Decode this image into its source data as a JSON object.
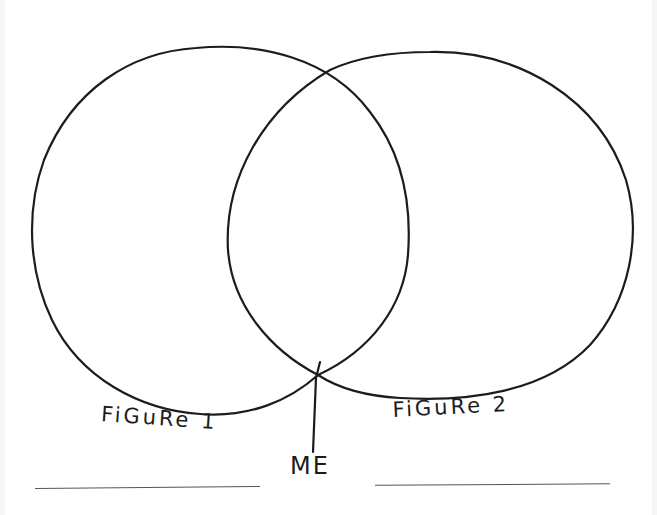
{
  "diagram": {
    "type": "venn",
    "style": "hand-drawn",
    "colors": {
      "background": "#ffffff",
      "ink": "#1c1c1c",
      "blank_line": "#555555"
    },
    "sets": [
      {
        "id": "set-left",
        "label": "FiGuRe 1"
      },
      {
        "id": "set-right",
        "label": "FiGuRe 2"
      }
    ],
    "intersection_pointer": {
      "label": "ME",
      "points_to": "lower intersection point of the two circles"
    },
    "blanks": [
      {
        "id": "blank-left",
        "under": "FiGuRe 1"
      },
      {
        "id": "blank-right",
        "under": "FiGuRe 2"
      }
    ]
  }
}
